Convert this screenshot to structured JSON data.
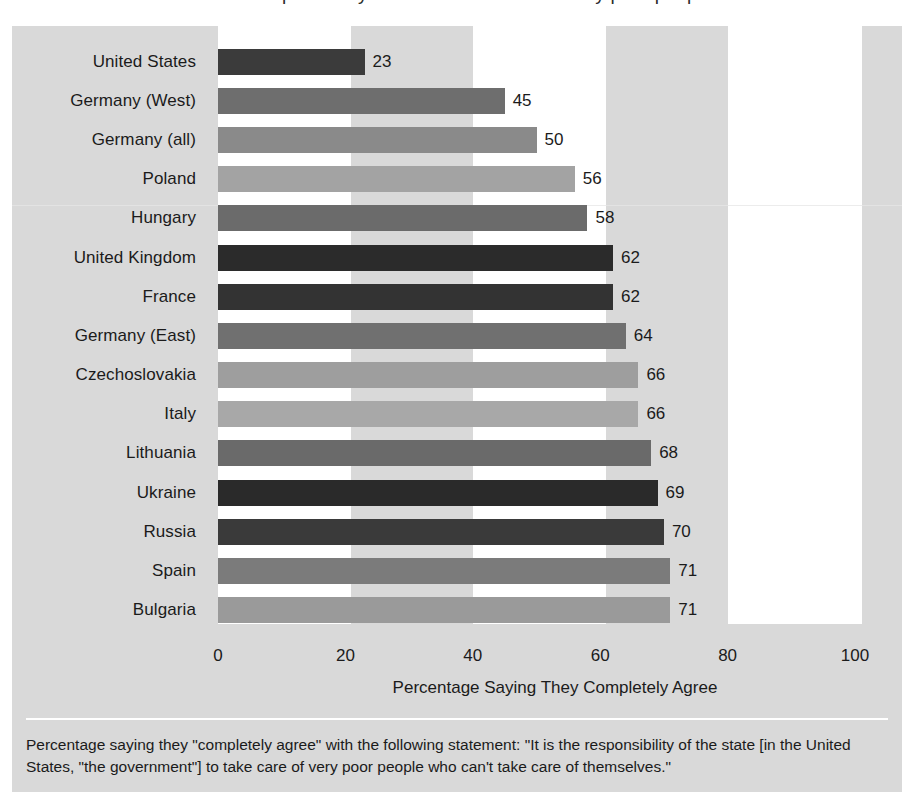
{
  "top_partial_line": "of the responsibility of the state to care for very poor people",
  "chart_data": {
    "type": "bar",
    "orientation": "horizontal",
    "title": "",
    "xlabel": "Percentage Saying They Completely Agree",
    "ylabel": "",
    "xlim": [
      0,
      100
    ],
    "grid": false,
    "legend": "none",
    "xticks": [
      "0",
      "20",
      "40",
      "60",
      "80",
      "100"
    ],
    "xtick_values": [
      0,
      20,
      40,
      60,
      80,
      100
    ],
    "categories": [
      "United States",
      "Germany (West)",
      "Germany (all)",
      "Poland",
      "Hungary",
      "United Kingdom",
      "France",
      "Germany (East)",
      "Czechoslovakia",
      "Italy",
      "Lithuania",
      "Ukraine",
      "Russia",
      "Spain",
      "Bulgaria"
    ],
    "values": [
      23,
      45,
      50,
      56,
      58,
      62,
      62,
      64,
      66,
      66,
      68,
      69,
      70,
      71,
      71
    ],
    "value_labels": [
      "23",
      "45",
      "50",
      "56",
      "58",
      "62",
      "62",
      "64",
      "66",
      "66",
      "68",
      "69",
      "70",
      "71",
      "71"
    ],
    "bar_colors": [
      "#3b3b3b",
      "#6e6e6e",
      "#8a8a8a",
      "#a3a3a3",
      "#6b6b6b",
      "#2b2b2b",
      "#333333",
      "#707070",
      "#9e9e9e",
      "#a8a8a8",
      "#6a6a6a",
      "#2a2a2a",
      "#3a3a3a",
      "#7b7b7b",
      "#9a9a9a"
    ]
  },
  "axis": {
    "title": "Percentage Saying They Completely Agree"
  },
  "caption": {
    "text": "Percentage saying they \"completely agree\" with the following statement: \"It is the responsibility of the state [in the United States, \"the government\"] to take care of very poor people who can't take care of themselves.\""
  },
  "colors": {
    "panel_background": "#d9d9d9",
    "band": "#ffffff",
    "text": "#1b1b1b",
    "divider": "#ffffff"
  }
}
